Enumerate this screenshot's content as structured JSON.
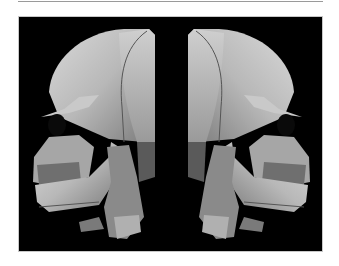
{
  "figure": {
    "background": "#000000",
    "panels": [
      {
        "view": "left lateral",
        "description": "3D CT volume rendering of skull, face toward left"
      },
      {
        "view": "right lateral",
        "description": "3D CT volume rendering of skull, face toward right"
      }
    ]
  },
  "caption": {
    "text": ""
  }
}
